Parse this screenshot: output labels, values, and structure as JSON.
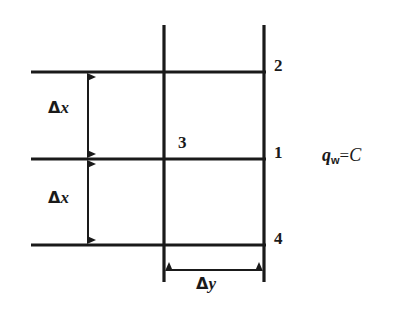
{
  "figure": {
    "background_color": "#ffffff",
    "line_color": "#1a1a1a",
    "type": "finite-difference-grid-wall-boundary"
  },
  "nodes": [
    {
      "key": "node2",
      "label": "2",
      "x": 274,
      "y": 57
    },
    {
      "key": "node1",
      "label": "1",
      "x": 274,
      "y": 144
    },
    {
      "key": "node4",
      "label": "4",
      "x": 274,
      "y": 230
    },
    {
      "key": "node3",
      "label": "3",
      "x": 178,
      "y": 134
    }
  ],
  "dimensions": [
    {
      "key": "dx_upper",
      "delta": "Δ",
      "variable": "x",
      "x": 48,
      "y": 99
    },
    {
      "key": "dx_lower",
      "delta": "Δ",
      "variable": "x",
      "x": 48,
      "y": 189
    },
    {
      "key": "dy",
      "delta": "Δ",
      "variable": "y",
      "x": 196,
      "y": 275
    }
  ],
  "boundary_condition": {
    "symbol": "q",
    "subscript": "w",
    "equals": "=",
    "value": "C",
    "x": 322,
    "y": 146
  },
  "geometry": {
    "horizontal_lines": [
      {
        "key": "line-top-2",
        "x1": 31,
        "x2": 266,
        "y": 72
      },
      {
        "key": "line-mid-1",
        "x1": 31,
        "x2": 266,
        "y": 159
      },
      {
        "key": "line-bottom-4",
        "x1": 31,
        "x2": 266,
        "y": 245
      }
    ],
    "vertical_lines": [
      {
        "key": "line-vert-inner",
        "x": 164,
        "y1": 25,
        "y2": 282
      },
      {
        "key": "line-vert-wall",
        "x": 264,
        "y1": 25,
        "y2": 282
      }
    ],
    "arrows": [
      {
        "key": "arrow-dx-upper",
        "orientation": "vertical",
        "x": 88,
        "y1": 72,
        "y2": 159
      },
      {
        "key": "arrow-dx-lower",
        "orientation": "vertical",
        "x": 88,
        "y1": 159,
        "y2": 245
      },
      {
        "key": "arrow-dy",
        "orientation": "horizontal",
        "y": 270,
        "x1": 164,
        "x2": 264
      }
    ]
  }
}
